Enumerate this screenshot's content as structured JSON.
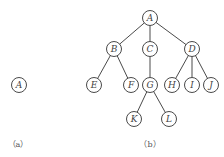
{
  "figures": [
    {
      "id": "a",
      "caption": "（a）",
      "nodes": [
        {
          "id": "A",
          "label": "A"
        }
      ],
      "edges": []
    },
    {
      "id": "b",
      "caption": "（b）",
      "nodes": [
        {
          "id": "A",
          "label": "A"
        },
        {
          "id": "B",
          "label": "B"
        },
        {
          "id": "C",
          "label": "C"
        },
        {
          "id": "D",
          "label": "D"
        },
        {
          "id": "E",
          "label": "E"
        },
        {
          "id": "F",
          "label": "F"
        },
        {
          "id": "G",
          "label": "G"
        },
        {
          "id": "H",
          "label": "H"
        },
        {
          "id": "I",
          "label": "I"
        },
        {
          "id": "J",
          "label": "J"
        },
        {
          "id": "K",
          "label": "K"
        },
        {
          "id": "L",
          "label": "L"
        }
      ],
      "edges": [
        [
          "A",
          "B"
        ],
        [
          "A",
          "C"
        ],
        [
          "A",
          "D"
        ],
        [
          "B",
          "E"
        ],
        [
          "B",
          "F"
        ],
        [
          "C",
          "G"
        ],
        [
          "D",
          "H"
        ],
        [
          "D",
          "I"
        ],
        [
          "D",
          "J"
        ],
        [
          "G",
          "K"
        ],
        [
          "G",
          "L"
        ]
      ]
    }
  ]
}
